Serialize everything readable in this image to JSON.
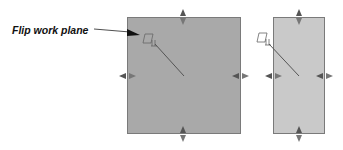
{
  "callout": {
    "label": "Flip work plane"
  },
  "panels": [
    {
      "name": "work-plane-original",
      "fill": "#a9a9a9"
    },
    {
      "name": "work-plane-flipped",
      "fill": "#c9c9c9"
    }
  ],
  "icons": {
    "work_plane_glyph": "work-plane-icon",
    "handle": "resize-arrow-handle-icon"
  },
  "colors": {
    "border": "#7a7a7a",
    "handle": "#555555",
    "line": "#555555",
    "text": "#111111"
  }
}
